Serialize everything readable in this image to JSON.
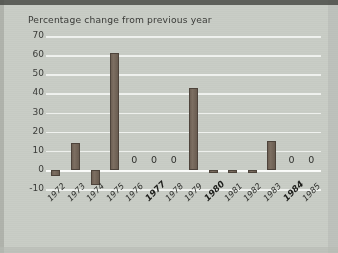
{
  "chart_data": {
    "type": "bar",
    "title": "Percentage change from previous year",
    "xlabel": "",
    "ylabel": "",
    "ylim": [
      -10,
      70
    ],
    "ytick_step": 10,
    "grid": true,
    "legend": "none",
    "categories": [
      "1972",
      "1973",
      "1974",
      "1975",
      "1976",
      "1977",
      "1978",
      "1979",
      "1980",
      "1981",
      "1982",
      "1983",
      "1984",
      "1985"
    ],
    "values": [
      -3,
      14,
      -8,
      61,
      0,
      0,
      0,
      43,
      -1,
      -1,
      -1,
      15,
      0,
      0
    ],
    "ytick_labels": [
      "70",
      "60",
      "50",
      "40",
      "30",
      "20",
      "10",
      "0",
      "-10"
    ],
    "ytick_values": [
      70,
      60,
      50,
      40,
      30,
      20,
      10,
      0,
      -10
    ],
    "zero_value_labels": [
      {
        "category": "1976",
        "label": "0"
      },
      {
        "category": "1977",
        "label": "0"
      },
      {
        "category": "1978",
        "label": "0"
      },
      {
        "category": "1984",
        "label": "0"
      },
      {
        "category": "1985",
        "label": "0"
      }
    ],
    "emphasized_categories": [
      "1977",
      "1980",
      "1984"
    ],
    "colors": {
      "bar": "#6e6054",
      "bar_border": "#4e443b",
      "background": "#c9cdc6",
      "gridline": "#f2f3f1",
      "text": "#2f302d"
    }
  }
}
